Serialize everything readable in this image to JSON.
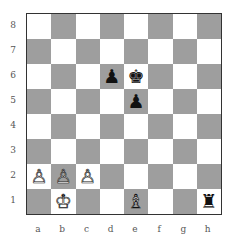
{
  "board": {
    "ranks": [
      "8",
      "7",
      "6",
      "5",
      "4",
      "3",
      "2",
      "1"
    ],
    "files": [
      "a",
      "b",
      "c",
      "d",
      "e",
      "f",
      "g",
      "h"
    ],
    "colors": {
      "light": "#ffffff",
      "dark": "#9e9e9e"
    },
    "pieces": [
      {
        "square": "d6",
        "color": "black",
        "type": "pawn",
        "glyph": "♟"
      },
      {
        "square": "e6",
        "color": "black",
        "type": "king",
        "glyph": "♚"
      },
      {
        "square": "e5",
        "color": "black",
        "type": "pawn",
        "glyph": "♟"
      },
      {
        "square": "a2",
        "color": "white",
        "type": "pawn",
        "glyph": "♙"
      },
      {
        "square": "b2",
        "color": "white",
        "type": "pawn",
        "glyph": "♙"
      },
      {
        "square": "c2",
        "color": "white",
        "type": "pawn",
        "glyph": "♙"
      },
      {
        "square": "b1",
        "color": "white",
        "type": "king",
        "glyph": "♔"
      },
      {
        "square": "e1",
        "color": "white",
        "type": "bishop",
        "glyph": "♗"
      },
      {
        "square": "h1",
        "color": "black",
        "type": "rook",
        "glyph": "♜"
      }
    ]
  }
}
